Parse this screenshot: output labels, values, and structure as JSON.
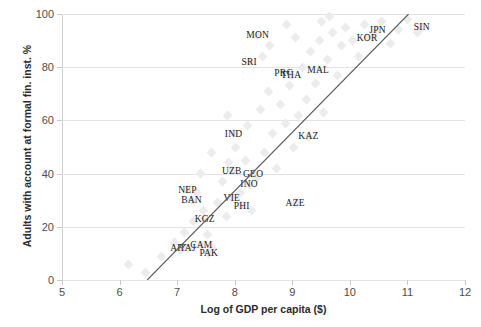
{
  "chart_data": {
    "type": "scatter",
    "title": "",
    "xlabel": "Log of GDP per capita ($)",
    "ylabel": "Adults with account at formal fin. inst. %",
    "xlim": [
      5,
      12
    ],
    "ylim": [
      0,
      100
    ],
    "xticks": [
      5,
      6,
      7,
      8,
      9,
      10,
      11,
      12
    ],
    "yticks": [
      0,
      20,
      40,
      60,
      80,
      100
    ],
    "grid": "horizontal",
    "legend": "none",
    "marker_color": "#ececec",
    "trendline_color": "#595959",
    "trendline": {
      "x0": 6.48,
      "y0": 0,
      "x1": 11.02,
      "y1": 100
    },
    "labeled_points": [
      {
        "label": "MON",
        "x": 8.4,
        "y": 92
      },
      {
        "label": "SRI",
        "x": 8.25,
        "y": 82
      },
      {
        "label": "PRC",
        "x": 8.85,
        "y": 78
      },
      {
        "label": "THA",
        "x": 8.98,
        "y": 77
      },
      {
        "label": "MAL",
        "x": 9.45,
        "y": 79
      },
      {
        "label": "KOR",
        "x": 10.3,
        "y": 91
      },
      {
        "label": "JPN",
        "x": 10.48,
        "y": 94
      },
      {
        "label": "SIN",
        "x": 11.25,
        "y": 95
      },
      {
        "label": "KAZ",
        "x": 9.28,
        "y": 54
      },
      {
        "label": "IND",
        "x": 7.98,
        "y": 55
      },
      {
        "label": "UZB",
        "x": 7.95,
        "y": 41
      },
      {
        "label": "GEO",
        "x": 8.32,
        "y": 40
      },
      {
        "label": "INO",
        "x": 8.25,
        "y": 36
      },
      {
        "label": "NEP",
        "x": 7.18,
        "y": 34
      },
      {
        "label": "BAN",
        "x": 7.25,
        "y": 30
      },
      {
        "label": "VIE",
        "x": 7.95,
        "y": 31
      },
      {
        "label": "PHI",
        "x": 8.12,
        "y": 28
      },
      {
        "label": "AZE",
        "x": 9.05,
        "y": 29
      },
      {
        "label": "KGZ",
        "x": 7.48,
        "y": 23
      },
      {
        "label": "AFG",
        "x": 7.05,
        "y": 12
      },
      {
        "label": "TAJ",
        "x": 7.18,
        "y": 12
      },
      {
        "label": "CAM",
        "x": 7.42,
        "y": 13
      },
      {
        "label": "PAK",
        "x": 7.55,
        "y": 10
      }
    ],
    "background_points": [
      {
        "x": 6.15,
        "y": 6
      },
      {
        "x": 6.45,
        "y": 3
      },
      {
        "x": 6.72,
        "y": 9
      },
      {
        "x": 6.95,
        "y": 14
      },
      {
        "x": 7.05,
        "y": 11
      },
      {
        "x": 7.12,
        "y": 18
      },
      {
        "x": 7.28,
        "y": 22
      },
      {
        "x": 7.33,
        "y": 33
      },
      {
        "x": 7.45,
        "y": 26
      },
      {
        "x": 7.52,
        "y": 17
      },
      {
        "x": 7.62,
        "y": 12
      },
      {
        "x": 7.7,
        "y": 29
      },
      {
        "x": 7.78,
        "y": 37
      },
      {
        "x": 7.85,
        "y": 24
      },
      {
        "x": 7.9,
        "y": 44
      },
      {
        "x": 8.02,
        "y": 50
      },
      {
        "x": 8.1,
        "y": 33
      },
      {
        "x": 8.18,
        "y": 45
      },
      {
        "x": 8.22,
        "y": 58
      },
      {
        "x": 8.3,
        "y": 26
      },
      {
        "x": 8.38,
        "y": 38
      },
      {
        "x": 8.45,
        "y": 64
      },
      {
        "x": 8.52,
        "y": 48
      },
      {
        "x": 8.58,
        "y": 71
      },
      {
        "x": 8.65,
        "y": 55
      },
      {
        "x": 8.72,
        "y": 42
      },
      {
        "x": 8.8,
        "y": 66
      },
      {
        "x": 8.88,
        "y": 59
      },
      {
        "x": 8.95,
        "y": 73
      },
      {
        "x": 9.02,
        "y": 50
      },
      {
        "x": 9.1,
        "y": 62
      },
      {
        "x": 9.18,
        "y": 80
      },
      {
        "x": 9.25,
        "y": 68
      },
      {
        "x": 9.32,
        "y": 86
      },
      {
        "x": 9.4,
        "y": 74
      },
      {
        "x": 9.48,
        "y": 90
      },
      {
        "x": 9.55,
        "y": 63
      },
      {
        "x": 9.62,
        "y": 83
      },
      {
        "x": 9.7,
        "y": 93
      },
      {
        "x": 9.78,
        "y": 77
      },
      {
        "x": 9.85,
        "y": 88
      },
      {
        "x": 9.92,
        "y": 95
      },
      {
        "x": 10.05,
        "y": 90
      },
      {
        "x": 10.15,
        "y": 84
      },
      {
        "x": 10.25,
        "y": 96
      },
      {
        "x": 10.4,
        "y": 92
      },
      {
        "x": 10.55,
        "y": 97
      },
      {
        "x": 10.7,
        "y": 89
      },
      {
        "x": 10.85,
        "y": 94
      },
      {
        "x": 11.0,
        "y": 98
      },
      {
        "x": 11.18,
        "y": 93
      },
      {
        "x": 9.5,
        "y": 97
      },
      {
        "x": 9.65,
        "y": 99
      },
      {
        "x": 8.9,
        "y": 96
      },
      {
        "x": 9.05,
        "y": 91
      },
      {
        "x": 8.6,
        "y": 88
      },
      {
        "x": 8.48,
        "y": 84
      },
      {
        "x": 7.88,
        "y": 62
      },
      {
        "x": 7.6,
        "y": 48
      },
      {
        "x": 7.4,
        "y": 40
      }
    ]
  }
}
